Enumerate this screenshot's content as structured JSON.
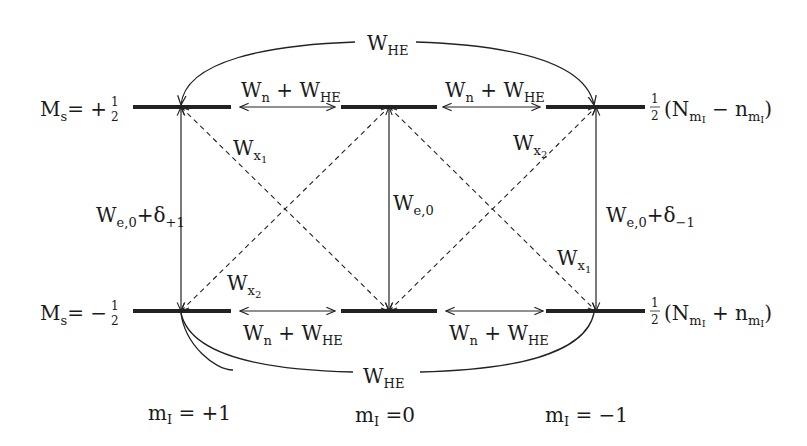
{
  "diagram": {
    "type": "energy-level transition diagram",
    "levels": {
      "upper": {
        "label_main": "M",
        "label_sub": "s",
        "label_rel": "= +",
        "frac_num": "1",
        "frac_den": "2",
        "population": {
          "coef_num": "1",
          "coef_den": "2",
          "open": "(N",
          "sub": "m",
          "subsub": "I",
          "op": " − n",
          "sub2": "m",
          "subsub2": "I",
          "close": ")"
        }
      },
      "lower": {
        "label_main": "M",
        "label_sub": "s",
        "label_rel": "= −",
        "frac_num": "1",
        "frac_den": "2",
        "population": {
          "coef_num": "1",
          "coef_den": "2",
          "open": "(N",
          "sub": "m",
          "subsub": "I",
          "op": " + n",
          "sub2": "m",
          "subsub2": "I",
          "close": ")"
        }
      }
    },
    "columns": [
      {
        "main": "m",
        "sub": "I",
        "rest": " = +1"
      },
      {
        "main": "m",
        "sub": "I",
        "rest": " =0"
      },
      {
        "main": "m",
        "sub": "I",
        "rest": " = −1"
      }
    ],
    "transitions": {
      "top_arc": {
        "main": "W",
        "sub": "HE"
      },
      "bottom_arc": {
        "main": "W",
        "sub": "HE"
      },
      "horizontal": {
        "main": "W",
        "sub": "n",
        "plus": " + W",
        "sub2": "HE"
      },
      "vertical_left": {
        "main": "W",
        "sub": "e,0",
        "plus": "+δ",
        "sub2": "+1"
      },
      "vertical_center": {
        "main": "W",
        "sub": "e,0"
      },
      "vertical_right": {
        "main": "W",
        "sub": "e,0",
        "plus": "+δ",
        "sub2": "−1"
      },
      "cross_x1": {
        "main": "W",
        "sub": "x",
        "subsub": "1"
      },
      "cross_x2": {
        "main": "W",
        "sub": "x",
        "subsub": "2"
      }
    }
  }
}
